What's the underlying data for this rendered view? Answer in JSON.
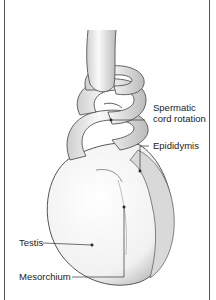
{
  "diagram": {
    "labels": {
      "spermatic_line1": "Spermatic",
      "spermatic_line2": "cord rotation",
      "epididymis": "Epididymis",
      "testis": "Testis",
      "mesorchium": "Mesorchium"
    }
  }
}
